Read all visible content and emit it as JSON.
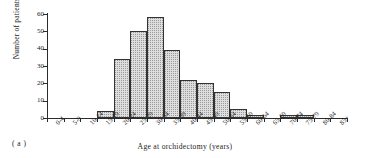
{
  "figure": {
    "caption": "( a )",
    "accent_color": "#dedede",
    "border_color": "#333333",
    "axis_color": "#2b2b2b"
  },
  "chart_data": {
    "type": "bar",
    "title": "",
    "subtitle": "",
    "xlabel": "Age at orchidectomy (years)",
    "ylabel": "Number of patients",
    "categories": [
      "0-4",
      "5-9",
      "10-14",
      "15-19",
      "20-24",
      "25-29",
      "30-34",
      "35-39",
      "40-44",
      "45-49",
      "50-54",
      "55-59",
      "60-64",
      "65-69",
      "70-74",
      "75-79",
      "80-84",
      "85+"
    ],
    "values": [
      0,
      0,
      0,
      4,
      34,
      50,
      58,
      39,
      22,
      20,
      15,
      5,
      2,
      0,
      1.5,
      1.5,
      0,
      0
    ],
    "ylim": [
      0,
      60
    ],
    "yticks": [
      0,
      10,
      20,
      30,
      40,
      50,
      60
    ],
    "ytick_labels": [
      "0",
      "10",
      "20",
      "30",
      "40",
      "50",
      "60"
    ],
    "grid": false,
    "legend": null,
    "legend_position": "none",
    "bar_style": "stippled-fill-black-outline"
  }
}
